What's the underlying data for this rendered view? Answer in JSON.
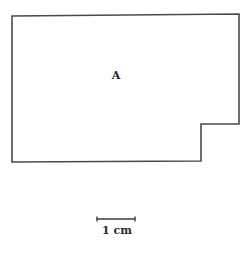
{
  "diagram": {
    "shape": {
      "label": "A",
      "stroke_color": "#4a4a4a",
      "points": [
        [
          12,
          16
        ],
        [
          239,
          14
        ],
        [
          239,
          124
        ],
        [
          201,
          124
        ],
        [
          201,
          161
        ],
        [
          12,
          162
        ]
      ]
    },
    "scale_bar": {
      "label": "1 cm",
      "x1": 97,
      "x2": 135,
      "y": 219
    }
  }
}
